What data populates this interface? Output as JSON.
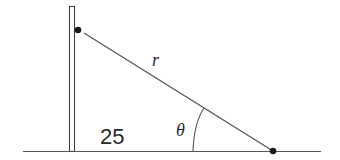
{
  "diagram": {
    "labels": {
      "hypotenuse": "r",
      "base": "25",
      "angle": "θ"
    },
    "elements": {
      "pole": "vertical-pole",
      "ground": "ground-line",
      "top_point": "dot-on-pole",
      "bottom_point": "dot-on-ground",
      "angle_arc": "arc-at-ground-point"
    },
    "colors": {
      "stroke": "#3a3a3a",
      "fill": "#1a1a1a",
      "background": "#ffffff"
    }
  }
}
